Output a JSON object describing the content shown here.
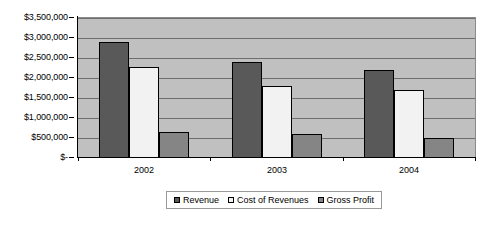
{
  "chart_data": {
    "type": "bar",
    "title": "",
    "subtitle": "",
    "xlabel": "",
    "ylabel": "",
    "categories": [
      "2002",
      "2003",
      "2004"
    ],
    "series": [
      {
        "name": "Revenue",
        "color": "#595959",
        "values": [
          2900000,
          2400000,
          2200000
        ]
      },
      {
        "name": "Cost of Revenues",
        "color": "#f2f2f2",
        "values": [
          2270000,
          1800000,
          1700000
        ]
      },
      {
        "name": "Gross Profit",
        "color": "#858585",
        "values": [
          640000,
          600000,
          500000
        ]
      }
    ],
    "ylim": [
      0,
      3500000
    ],
    "ytick_values": [
      0,
      500000,
      1000000,
      1500000,
      2000000,
      2500000,
      3000000,
      3500000
    ],
    "ytick_labels": [
      "$-",
      "$500,000",
      "$1,000,000",
      "$1,500,000",
      "$2,000,000",
      "$2,500,000",
      "$3,000,000",
      "$3,500,000"
    ],
    "grid": true,
    "legend_position": "bottom",
    "plot_background": "#c0c0c0",
    "gridline_color": "#6e6e6e"
  }
}
